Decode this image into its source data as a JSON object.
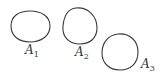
{
  "diagram": {
    "shapes": [
      {
        "id": "A1",
        "label": "A",
        "subscript": "1"
      },
      {
        "id": "A2",
        "label": "A",
        "subscript": "2"
      },
      {
        "id": "A3",
        "label": "A",
        "subscript": "3"
      }
    ],
    "stroke_color": "#3a3a3a",
    "text_color": "#333333"
  }
}
